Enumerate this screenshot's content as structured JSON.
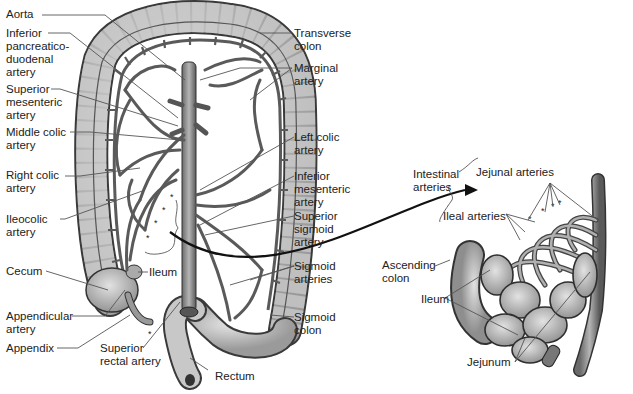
{
  "diagram": {
    "left_panel": {
      "labels_left": [
        {
          "id": "aorta",
          "text": "Aorta"
        },
        {
          "id": "inferior-pancreaticoduodenal-artery",
          "text": "Inferior\npancreatico-\nduodenal\nartery"
        },
        {
          "id": "superior-mesenteric-artery",
          "text": "Superior\nmesenteric\nartery"
        },
        {
          "id": "middle-colic-artery",
          "text": "Middle colic\nartery"
        },
        {
          "id": "right-colic-artery",
          "text": "Right colic\nartery"
        },
        {
          "id": "ileocolic-artery",
          "text": "Ileocolic\nartery"
        },
        {
          "id": "cecum",
          "text": "Cecum"
        },
        {
          "id": "appendicular-artery",
          "text": "Appendicular\nartery"
        },
        {
          "id": "appendix",
          "text": "Appendix"
        }
      ],
      "labels_center": [
        {
          "id": "ileum",
          "text": "Ileum"
        },
        {
          "id": "superior-rectal-artery",
          "text": "Superior\nrectal artery"
        },
        {
          "id": "rectum",
          "text": "Rectum"
        }
      ],
      "labels_right": [
        {
          "id": "transverse-colon",
          "text": "Transverse\ncolon"
        },
        {
          "id": "marginal-artery",
          "text": "Marginal\nartery"
        },
        {
          "id": "left-colic-artery",
          "text": "Left colic\nartery"
        },
        {
          "id": "inferior-mesenteric-artery",
          "text": "Inferior\nmesenteric\nartery"
        },
        {
          "id": "superior-sigmoid-artery",
          "text": "Superior\nsigmoid\nartery"
        },
        {
          "id": "sigmoid-arteries",
          "text": "Sigmoid\narteries"
        },
        {
          "id": "sigmoid-colon",
          "text": "Sigmoid\ncolon"
        }
      ]
    },
    "right_panel": {
      "labels": [
        {
          "id": "intestinal-arteries",
          "text": "Intestinal\narteries"
        },
        {
          "id": "jejunal-arteries",
          "text": "Jejunal arteries"
        },
        {
          "id": "ileal-arteries",
          "text": "Ileal arteries"
        },
        {
          "id": "ascending-colon",
          "text": "Ascending\ncolon"
        },
        {
          "id": "ileum-detail",
          "text": "Ileum"
        },
        {
          "id": "jejunum",
          "text": "Jejunum"
        }
      ]
    },
    "colors": {
      "colon_fill": "#c9c9c9",
      "colon_stroke": "#3a3a3a",
      "artery": "#5a5a5a",
      "leader_line": "#555555",
      "background": "#ffffff"
    }
  }
}
